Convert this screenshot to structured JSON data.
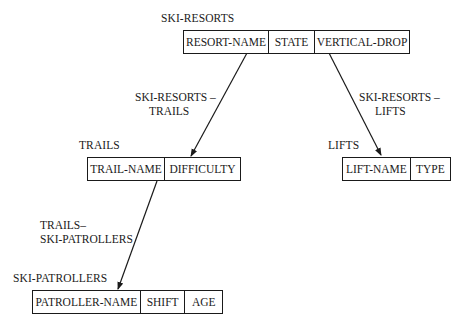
{
  "diagram": {
    "records": {
      "ski_resorts": {
        "name": "SKI-RESORTS",
        "fields": [
          "RESORT-NAME",
          "STATE",
          "VERTICAL-DROP"
        ]
      },
      "trails": {
        "name": "TRAILS",
        "fields": [
          "TRAIL-NAME",
          "DIFFICULTY"
        ]
      },
      "lifts": {
        "name": "LIFTS",
        "fields": [
          "LIFT-NAME",
          "TYPE"
        ]
      },
      "ski_patrollers": {
        "name": "SKI-PATROLLERS",
        "fields": [
          "PATROLLER-NAME",
          "SHIFT",
          "AGE"
        ]
      }
    },
    "relationships": {
      "resorts_trails": {
        "line1": "SKI-RESORTS –",
        "line2": "TRAILS"
      },
      "resorts_lifts": {
        "line1": "SKI-RESORTS –",
        "line2": "LIFTS"
      },
      "trails_patrollers": {
        "line1": "TRAILS–",
        "line2": "SKI-PATROLLERS"
      }
    }
  }
}
